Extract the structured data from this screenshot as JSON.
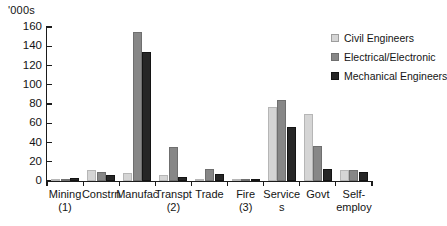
{
  "chart_data": {
    "type": "bar",
    "title": "",
    "subtitle": "",
    "unit_label": "'000s",
    "xlabel": "",
    "ylabel": "",
    "ylim": [
      0,
      160
    ],
    "ytick_step": 20,
    "yticks": [
      0,
      20,
      40,
      60,
      80,
      100,
      120,
      140,
      160
    ],
    "grid": false,
    "legend_position": "top-right",
    "orientation": "vertical",
    "grouping": "grouped",
    "categories": [
      "Mining (1)",
      "Constrn",
      "Manufac",
      "Transpt (2)",
      "Trade",
      "Fire (3)",
      "Services",
      "Govt",
      "Self-employ"
    ],
    "category_labels": [
      {
        "line1": "Mining",
        "line2": "(1)"
      },
      {
        "line1": "Constrn",
        "line2": ""
      },
      {
        "line1": "Manufac",
        "line2": ""
      },
      {
        "line1": "Transpt",
        "line2": "(2)"
      },
      {
        "line1": "Trade",
        "line2": ""
      },
      {
        "line1": "Fire",
        "line2": "(3)"
      },
      {
        "line1": "Service",
        "line2": "s"
      },
      {
        "line1": "Govt",
        "line2": ""
      },
      {
        "line1": "Self-",
        "line2": "employ"
      }
    ],
    "series": [
      {
        "name": "Civil Engineers",
        "color": "#d5d5d5",
        "values": [
          1,
          11.5,
          8.5,
          6.5,
          1,
          1,
          77,
          70,
          11
        ]
      },
      {
        "name": "Electrical/Electronic",
        "color": "#878787",
        "values": [
          2,
          9.5,
          155,
          35.5,
          12.5,
          2,
          84,
          36,
          11
        ]
      },
      {
        "name": "Mechanical Engineers",
        "color": "#262626",
        "values": [
          3.5,
          6,
          134,
          4,
          7,
          1.5,
          56,
          13,
          9
        ]
      }
    ],
    "legend": [
      "Civil Engineers",
      "Electrical/Electronic",
      "Mechanical Engineers"
    ]
  }
}
